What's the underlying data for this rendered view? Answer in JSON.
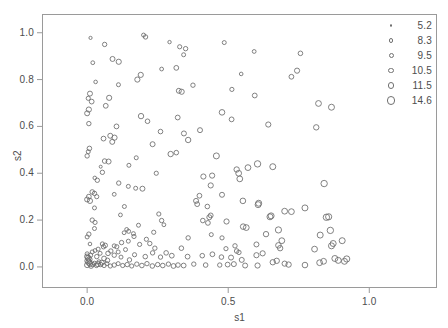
{
  "chart_data": {
    "type": "scatter",
    "title": "",
    "xlabel": "s1",
    "ylabel": "s2",
    "xlim": [
      -0.16,
      1.24
    ],
    "ylim": [
      -0.09,
      1.08
    ],
    "xticks": [
      0.0,
      0.5,
      1.0
    ],
    "xticklabels": [
      "0.0",
      "0.5",
      "1.0"
    ],
    "yticks": [
      0.0,
      0.2,
      0.4,
      0.6,
      0.8,
      1.0
    ],
    "yticklabels": [
      "0.0",
      "0.2",
      "0.4",
      "0.6",
      "0.8",
      "1.0"
    ],
    "grid": false,
    "marker": "open-circle",
    "marker_color": "#6b6b6b",
    "frame_color": "#9a9a9a",
    "background": "#ffffff",
    "size_encoding": "bubble-size",
    "legend": {
      "position": "top-right",
      "title": "",
      "entries": [
        {
          "label": "5.2",
          "radius_px": 1.3
        },
        {
          "label": "8.3",
          "radius_px": 2.1
        },
        {
          "label": "9.5",
          "radius_px": 2.5
        },
        {
          "label": "10.5",
          "radius_px": 2.9
        },
        {
          "label": "11.5",
          "radius_px": 3.3
        },
        {
          "label": "14.6",
          "radius_px": 4.2
        }
      ]
    },
    "points": [
      [
        0.012,
        0.978,
        1.6
      ],
      [
        0.062,
        0.95,
        2.2
      ],
      [
        0.2,
        0.99,
        2.0
      ],
      [
        0.207,
        0.982,
        2.2
      ],
      [
        0.292,
        0.96,
        1.7
      ],
      [
        0.486,
        0.958,
        2.0
      ],
      [
        0.328,
        0.94,
        2.1
      ],
      [
        0.349,
        0.932,
        2.2
      ],
      [
        0.592,
        0.92,
        1.9
      ],
      [
        0.756,
        0.912,
        2.3
      ],
      [
        0.342,
        0.906,
        2.0
      ],
      [
        0.02,
        0.872,
        1.9
      ],
      [
        0.09,
        0.888,
        2.5
      ],
      [
        0.112,
        0.876,
        2.6
      ],
      [
        0.264,
        0.845,
        1.9
      ],
      [
        0.316,
        0.85,
        2.4
      ],
      [
        0.744,
        0.838,
        2.6
      ],
      [
        0.724,
        0.812,
        2.4
      ],
      [
        0.546,
        0.824,
        1.8
      ],
      [
        0.19,
        0.82,
        2.6
      ],
      [
        0.178,
        0.8,
        2.6
      ],
      [
        0.03,
        0.79,
        1.8
      ],
      [
        0.111,
        0.778,
        2.0
      ],
      [
        0.375,
        0.776,
        2.2
      ],
      [
        0.325,
        0.752,
        2.5
      ],
      [
        0.335,
        0.748,
        2.6
      ],
      [
        0.513,
        0.758,
        2.1
      ],
      [
        0.594,
        0.732,
        2.4
      ],
      [
        0.01,
        0.74,
        2.5
      ],
      [
        0.004,
        0.72,
        2.1
      ],
      [
        0.016,
        0.706,
        2.4
      ],
      [
        0.078,
        0.722,
        2.6
      ],
      [
        0.066,
        0.688,
        2.4
      ],
      [
        0.006,
        0.672,
        2.6
      ],
      [
        0.0,
        0.656,
        2.5
      ],
      [
        0.82,
        0.698,
        2.9
      ],
      [
        0.866,
        0.682,
        3.0
      ],
      [
        0.478,
        0.66,
        2.8
      ],
      [
        0.006,
        0.612,
        2.2
      ],
      [
        0.191,
        0.644,
        2.7
      ],
      [
        0.214,
        0.622,
        2.3
      ],
      [
        0.104,
        0.6,
        2.4
      ],
      [
        0.321,
        0.638,
        2.4
      ],
      [
        0.642,
        0.608,
        2.6
      ],
      [
        0.512,
        0.63,
        2.4
      ],
      [
        0.812,
        0.596,
        2.7
      ],
      [
        0.26,
        0.578,
        2.3
      ],
      [
        0.343,
        0.57,
        2.5
      ],
      [
        0.4,
        0.584,
        2.5
      ],
      [
        0.082,
        0.56,
        2.5
      ],
      [
        0.058,
        0.548,
        2.4
      ],
      [
        0.097,
        0.552,
        2.6
      ],
      [
        0.089,
        0.534,
        2.5
      ],
      [
        0.358,
        0.542,
        2.7
      ],
      [
        0.232,
        0.524,
        2.5
      ],
      [
        0.008,
        0.506,
        2.3
      ],
      [
        0.004,
        0.492,
        2.0
      ],
      [
        0.0,
        0.474,
        2.2
      ],
      [
        0.174,
        0.466,
        2.0
      ],
      [
        0.296,
        0.482,
        2.7
      ],
      [
        0.062,
        0.452,
        2.3
      ],
      [
        0.076,
        0.45,
        2.5
      ],
      [
        0.316,
        0.488,
        2.3
      ],
      [
        0.458,
        0.474,
        3.0
      ],
      [
        0.048,
        0.428,
        1.5
      ],
      [
        0.148,
        0.434,
        2.0
      ],
      [
        0.57,
        0.424,
        2.9
      ],
      [
        0.604,
        0.44,
        3.2
      ],
      [
        0.53,
        0.416,
        2.7
      ],
      [
        0.537,
        0.4,
        2.9
      ],
      [
        0.658,
        0.428,
        3.0
      ],
      [
        0.054,
        0.404,
        2.2
      ],
      [
        0.245,
        0.4,
        2.1
      ],
      [
        0.412,
        0.386,
        2.6
      ],
      [
        0.443,
        0.39,
        2.6
      ],
      [
        0.541,
        0.376,
        2.9
      ],
      [
        0.036,
        0.37,
        2.2
      ],
      [
        0.112,
        0.358,
        2.2
      ],
      [
        0.146,
        0.344,
        2.0
      ],
      [
        0.027,
        0.38,
        1.8
      ],
      [
        0.196,
        0.334,
        2.5
      ],
      [
        0.172,
        0.336,
        2.0
      ],
      [
        0.84,
        0.356,
        3.2
      ],
      [
        0.438,
        0.348,
        2.6
      ],
      [
        0.018,
        0.32,
        2.3
      ],
      [
        0.026,
        0.314,
        2.2
      ],
      [
        0.006,
        0.3,
        2.4
      ],
      [
        0.034,
        0.3,
        2.1
      ],
      [
        0.096,
        0.31,
        1.9
      ],
      [
        0.0,
        0.288,
        2.5
      ],
      [
        0.01,
        0.282,
        2.6
      ],
      [
        0.478,
        0.308,
        2.5
      ],
      [
        0.398,
        0.304,
        2.4
      ],
      [
        0.386,
        0.282,
        2.5
      ],
      [
        0.39,
        0.268,
        2.4
      ],
      [
        0.552,
        0.282,
        2.8
      ],
      [
        0.426,
        0.258,
        2.3
      ],
      [
        0.606,
        0.266,
        3.0
      ],
      [
        0.608,
        0.272,
        3.0
      ],
      [
        0.026,
        0.252,
        2.0
      ],
      [
        0.132,
        0.258,
        2.0
      ],
      [
        0.254,
        0.226,
        2.1
      ],
      [
        0.438,
        0.22,
        2.4
      ],
      [
        0.433,
        0.212,
        2.5
      ],
      [
        0.648,
        0.214,
        3.0
      ],
      [
        0.652,
        0.218,
        3.0
      ],
      [
        0.7,
        0.238,
        2.9
      ],
      [
        0.724,
        0.236,
        2.9
      ],
      [
        0.772,
        0.252,
        3.0
      ],
      [
        0.118,
        0.222,
        1.9
      ],
      [
        0.018,
        0.2,
        2.2
      ],
      [
        0.028,
        0.19,
        2.1
      ],
      [
        0.264,
        0.198,
        2.2
      ],
      [
        0.41,
        0.198,
        2.3
      ],
      [
        0.428,
        0.188,
        2.4
      ],
      [
        0.272,
        0.18,
        1.9
      ],
      [
        0.494,
        0.194,
        2.6
      ],
      [
        0.553,
        0.172,
        2.8
      ],
      [
        0.564,
        0.168,
        2.9
      ],
      [
        0.182,
        0.178,
        2.0
      ],
      [
        0.678,
        0.158,
        3.1
      ],
      [
        0.026,
        0.164,
        2.0
      ],
      [
        0.14,
        0.16,
        1.9
      ],
      [
        0.147,
        0.152,
        2.0
      ],
      [
        0.236,
        0.148,
        2.1
      ],
      [
        0.131,
        0.146,
        1.9
      ],
      [
        0.44,
        0.138,
        2.0
      ],
      [
        0.358,
        0.124,
        2.2
      ],
      [
        0.478,
        0.124,
        2.1
      ],
      [
        0.634,
        0.14,
        2.7
      ],
      [
        0.69,
        0.112,
        2.9
      ],
      [
        0.006,
        0.14,
        2.2
      ],
      [
        0.0,
        0.128,
        2.0
      ],
      [
        0.678,
        0.092,
        2.8
      ],
      [
        0.684,
        0.08,
        2.7
      ],
      [
        0.01,
        0.098,
        1.8
      ],
      [
        0.146,
        0.11,
        2.0
      ],
      [
        0.122,
        0.104,
        2.2
      ],
      [
        0.054,
        0.098,
        2.1
      ],
      [
        0.064,
        0.092,
        2.3
      ],
      [
        0.058,
        0.086,
        2.2
      ],
      [
        0.096,
        0.09,
        2.0
      ],
      [
        0.186,
        0.096,
        2.1
      ],
      [
        0.6,
        0.096,
        2.5
      ],
      [
        0.524,
        0.09,
        2.2
      ],
      [
        0.492,
        0.078,
        2.1
      ],
      [
        0.039,
        0.076,
        2.0
      ],
      [
        0.028,
        0.07,
        1.9
      ],
      [
        0.53,
        0.068,
        2.3
      ],
      [
        0.538,
        0.062,
        2.2
      ],
      [
        0.0,
        0.056,
        2.0
      ],
      [
        0.012,
        0.05,
        2.2
      ],
      [
        0.0,
        0.044,
        2.6
      ],
      [
        0.004,
        0.038,
        2.8
      ],
      [
        0.008,
        0.032,
        2.7
      ],
      [
        0.002,
        0.026,
        2.9
      ],
      [
        0.006,
        0.02,
        3.0
      ],
      [
        0.01,
        0.014,
        2.8
      ],
      [
        0.0,
        0.008,
        2.6
      ],
      [
        0.014,
        0.004,
        2.4
      ],
      [
        0.02,
        0.01,
        2.2
      ],
      [
        0.026,
        0.016,
        2.0
      ],
      [
        0.033,
        0.006,
        2.1
      ],
      [
        0.042,
        0.022,
        2.0
      ],
      [
        0.048,
        0.01,
        2.2
      ],
      [
        0.06,
        0.006,
        2.1
      ],
      [
        0.07,
        0.014,
        2.0
      ],
      [
        0.082,
        0.004,
        2.1
      ],
      [
        0.096,
        0.008,
        2.2
      ],
      [
        0.11,
        0.014,
        2.0
      ],
      [
        0.126,
        0.006,
        2.1
      ],
      [
        0.142,
        0.01,
        2.2
      ],
      [
        0.158,
        0.004,
        2.1
      ],
      [
        0.176,
        0.012,
        2.2
      ],
      [
        0.194,
        0.006,
        2.3
      ],
      [
        0.212,
        0.014,
        2.2
      ],
      [
        0.231,
        0.004,
        2.3
      ],
      [
        0.25,
        0.01,
        2.2
      ],
      [
        0.268,
        0.006,
        2.3
      ],
      [
        0.288,
        0.012,
        2.2
      ],
      [
        0.306,
        0.004,
        2.4
      ],
      [
        0.322,
        0.008,
        2.3
      ],
      [
        0.342,
        0.006,
        2.4
      ],
      [
        0.15,
        0.03,
        2.2
      ],
      [
        0.12,
        0.042,
        2.0
      ],
      [
        0.096,
        0.05,
        2.2
      ],
      [
        0.074,
        0.058,
        2.3
      ],
      [
        0.11,
        0.064,
        2.0
      ],
      [
        0.168,
        0.052,
        2.1
      ],
      [
        0.206,
        0.044,
        2.3
      ],
      [
        0.26,
        0.042,
        2.2
      ],
      [
        0.3,
        0.048,
        2.4
      ],
      [
        0.356,
        0.044,
        2.4
      ],
      [
        0.408,
        0.048,
        2.3
      ],
      [
        0.444,
        0.054,
        2.4
      ],
      [
        0.476,
        0.042,
        2.3
      ],
      [
        0.51,
        0.04,
        2.5
      ],
      [
        0.548,
        0.03,
        2.5
      ],
      [
        0.498,
        0.01,
        2.4
      ],
      [
        0.52,
        0.012,
        2.5
      ],
      [
        0.56,
        0.006,
        2.5
      ],
      [
        0.42,
        0.008,
        2.3
      ],
      [
        0.378,
        0.012,
        2.2
      ],
      [
        0.658,
        0.02,
        2.7
      ],
      [
        0.672,
        0.026,
        2.7
      ],
      [
        0.7,
        0.014,
        2.6
      ],
      [
        0.714,
        0.01,
        2.7
      ],
      [
        0.772,
        0.008,
        2.8
      ],
      [
        0.824,
        0.018,
        2.9
      ],
      [
        0.838,
        0.024,
        2.9
      ],
      [
        0.878,
        0.036,
        3.0
      ],
      [
        0.89,
        0.028,
        3.0
      ],
      [
        0.912,
        0.024,
        3.0
      ],
      [
        0.92,
        0.034,
        3.1
      ],
      [
        0.806,
        0.076,
        2.9
      ],
      [
        0.826,
        0.136,
        3.0
      ],
      [
        0.862,
        0.156,
        3.2
      ],
      [
        0.872,
        0.1,
        3.0
      ],
      [
        0.866,
        0.09,
        3.0
      ],
      [
        0.848,
        0.212,
        3.2
      ],
      [
        0.856,
        0.214,
        3.1
      ],
      [
        0.904,
        0.112,
        3.0
      ],
      [
        0.47,
        0.008,
        2.2
      ],
      [
        0.604,
        0.006,
        2.6
      ],
      [
        0.136,
        0.074,
        2.0
      ],
      [
        0.166,
        0.13,
        2.1
      ],
      [
        0.164,
        0.142,
        2.0
      ],
      [
        0.105,
        0.086,
        2.1
      ],
      [
        0.046,
        0.058,
        2.0
      ],
      [
        0.034,
        0.044,
        2.2
      ],
      [
        0.018,
        0.064,
        2.0
      ],
      [
        0.084,
        0.068,
        2.2
      ],
      [
        0.06,
        0.036,
        2.4
      ],
      [
        0.072,
        0.028,
        2.3
      ],
      [
        0.052,
        0.018,
        2.5
      ],
      [
        0.038,
        0.012,
        2.6
      ],
      [
        0.24,
        0.08,
        2.2
      ],
      [
        0.222,
        0.1,
        2.2
      ],
      [
        0.21,
        0.118,
        2.1
      ],
      [
        0.334,
        0.08,
        2.3
      ],
      [
        0.6,
        0.05,
        2.6
      ],
      [
        0.622,
        0.058,
        2.6
      ],
      [
        0.232,
        0.06,
        2.2
      ],
      [
        0.28,
        0.06,
        2.3
      ]
    ]
  }
}
